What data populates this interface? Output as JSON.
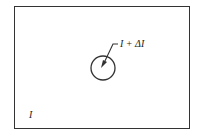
{
  "diagram": {
    "outer_region_label": "I",
    "inner_region_label": "I + ΔI",
    "shapes": {
      "outer": "rectangle",
      "inner": "circle",
      "pointer": "arrow-from-label-into-circle"
    },
    "colors": {
      "stroke": "#333333",
      "background": "#ffffff"
    }
  }
}
